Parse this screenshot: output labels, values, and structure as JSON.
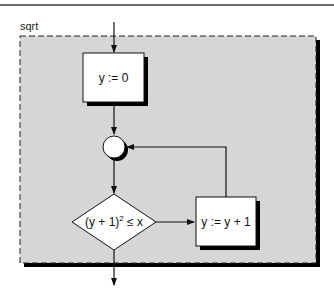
{
  "diagram": {
    "title": "sqrt",
    "colors": {
      "region_fill": "#d6d6d6",
      "box_fill": "#ffffff",
      "shadow": "#000000",
      "stroke": "#111111"
    },
    "nodes": [
      {
        "id": "init",
        "type": "process",
        "label": "y := 0"
      },
      {
        "id": "join",
        "type": "connector",
        "label": ""
      },
      {
        "id": "test",
        "type": "decision",
        "label_base": "(y + 1)",
        "label_sup": "2",
        "label_rest": " ≤ x"
      },
      {
        "id": "incr",
        "type": "process",
        "label": "y := y + 1"
      }
    ],
    "edges": [
      {
        "from": "entry",
        "to": "init"
      },
      {
        "from": "init",
        "to": "join"
      },
      {
        "from": "join",
        "to": "test"
      },
      {
        "from": "test",
        "to": "incr"
      },
      {
        "from": "incr",
        "to": "join"
      },
      {
        "from": "test",
        "to": "exit"
      }
    ]
  }
}
